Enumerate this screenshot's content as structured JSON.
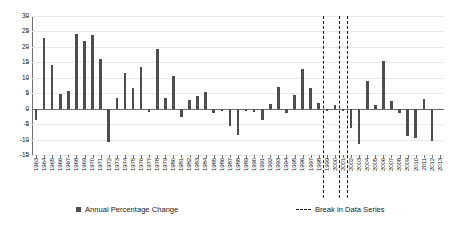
{
  "chart_data": {
    "type": "bar",
    "title": "",
    "subtitle": "",
    "xlabel": "",
    "ylabel": "",
    "ylim": [
      -15,
      30
    ],
    "yticks": [
      30,
      25,
      20,
      15,
      10,
      5,
      0,
      -5,
      -10,
      -15
    ],
    "grid": true,
    "legend_position": "bottom",
    "series_name": "Annual Percentage Change",
    "bar_color": "#4d4d4d",
    "categories": [
      "1963",
      "1964",
      "1965",
      "1966",
      "1967",
      "1968",
      "1969",
      "1970",
      "1971",
      "1972",
      "1973",
      "1974",
      "1975",
      "1976",
      "1977",
      "1978",
      "1979",
      "1980",
      "1981",
      "1982",
      "1983",
      "1984",
      "1985",
      "1986",
      "1987",
      "1988",
      "1989",
      "1990",
      "1991",
      "1992",
      "1993",
      "1994",
      "1995",
      "1996",
      "1997",
      "1998",
      "1999",
      "2000",
      "2001",
      "2002",
      "2003",
      "2004",
      "2005",
      "2006",
      "2007",
      "2008",
      "2009",
      "2010",
      "2011",
      "2012",
      "2013"
    ],
    "values": [
      -3.8,
      23.0,
      14.0,
      4.8,
      5.6,
      24.3,
      22.0,
      23.9,
      16.2,
      -10.7,
      3.6,
      11.4,
      6.7,
      13.6,
      -1.0,
      19.4,
      3.5,
      10.6,
      -2.6,
      2.9,
      4.0,
      5.4,
      -1.3,
      -0.8,
      -5.6,
      -8.4,
      -0.9,
      -1.2,
      -3.6,
      1.6,
      7.0,
      -1.5,
      4.4,
      13.0,
      6.6,
      1.9,
      -0.6,
      1.2,
      -0.9,
      -6.2,
      -11.5,
      8.9,
      1.3,
      15.3,
      2.5,
      -1.4,
      -8.9,
      -9.6,
      3.1,
      -10.4,
      -0.5
    ],
    "annotations": [
      {
        "label": "Break in Data Series",
        "at_category": "1998"
      },
      {
        "label": "Break in Data Series",
        "at_category": "2000"
      },
      {
        "label": "Break in Data Series",
        "at_category": "2001"
      }
    ],
    "break_line_color": "#1a1a1a",
    "break_line_style": "dashed"
  },
  "legend": {
    "series_label": "Annual Percentage Change",
    "break_label": "Break in Data Series"
  }
}
